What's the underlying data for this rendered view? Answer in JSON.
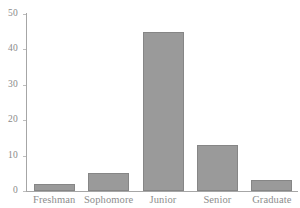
{
  "chart_data": {
    "type": "bar",
    "title": "",
    "subtitle": "",
    "xlabel": "",
    "ylabel": "",
    "categories": [
      "Freshman",
      "Sophomore",
      "Junior",
      "Senior",
      "Graduate"
    ],
    "values": [
      2,
      5,
      45,
      13,
      3
    ],
    "ylim": [
      0,
      50
    ],
    "yticks": [
      0,
      10,
      20,
      30,
      40,
      50
    ],
    "ytick_labels": [
      "0",
      "10",
      "20",
      "30",
      "40",
      "50"
    ],
    "grid": false,
    "legend": false,
    "legend_position": "none",
    "annotations": [],
    "colors": {
      "bar_fill": "#9a9a9a",
      "bar_border": "#868686",
      "axis": "#a6a6a6",
      "tick_text": "#8a8a8a",
      "category_text": "#8d8d8d",
      "background": "#ffffff"
    }
  }
}
